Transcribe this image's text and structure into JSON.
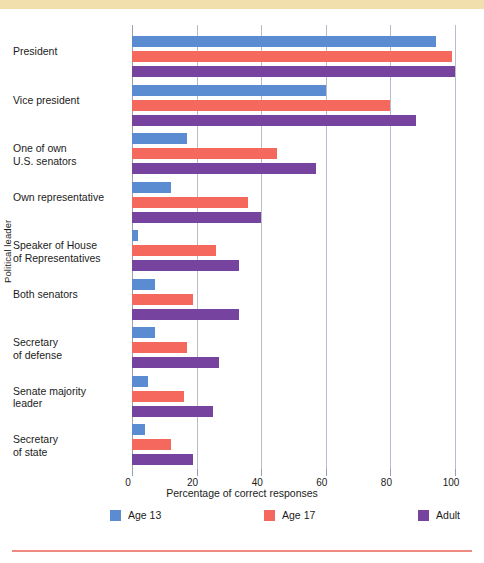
{
  "chart_data": {
    "type": "bar",
    "orientation": "horizontal",
    "title": "",
    "xlabel": "Percentage of correct responses",
    "ylabel": "Political leader",
    "xlim": [
      0,
      100
    ],
    "xticks": [
      0,
      20,
      40,
      60,
      80,
      100
    ],
    "grid": true,
    "legend_position": "bottom",
    "categories": [
      "President",
      "Vice president",
      "One of own\nU.S. senators",
      "Own representative",
      "Speaker of House\nof Representatives",
      "Both senators",
      "Secretary\nof defense",
      "Senate majority\nleader",
      "Secretary\nof state"
    ],
    "series": [
      {
        "name": "Age 13",
        "color": "#5b8bd0",
        "values": [
          94,
          60,
          17,
          12,
          2,
          7,
          7,
          5,
          4
        ]
      },
      {
        "name": "Age 17",
        "color": "#f4685e",
        "values": [
          99,
          80,
          45,
          36,
          26,
          19,
          17,
          16,
          12
        ]
      },
      {
        "name": "Adult",
        "color": "#76439e",
        "values": [
          100,
          88,
          57,
          40,
          33,
          33,
          27,
          25,
          19
        ]
      }
    ]
  },
  "decor": {
    "top_strip_color": "#f2dfae",
    "bottom_rule_color": "#ef8a80"
  }
}
